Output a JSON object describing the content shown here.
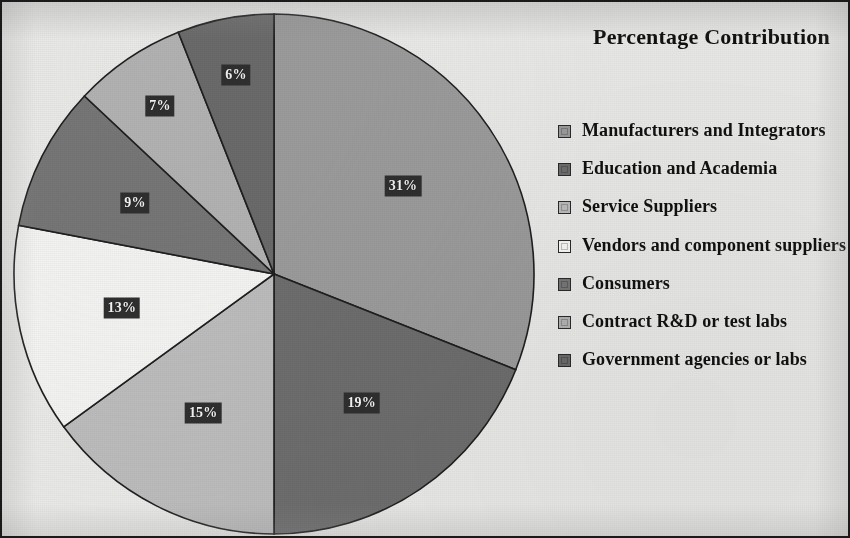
{
  "figure": {
    "title": "Percentage Contribution",
    "border_color": "#1a1a1a",
    "background_color": "#e9e9e7"
  },
  "chart_data": {
    "type": "pie",
    "title": "Percentage Contribution",
    "xlabel": "",
    "ylabel": "",
    "legend_position": "right",
    "grid": false,
    "start_angle_deg": 0,
    "direction": "clockwise",
    "units": "percent",
    "categories": [
      "Manufacturers and Integrators",
      "Education and Academia",
      "Service Suppliers",
      "Vendors and component suppliers",
      "Consumers",
      "Contract R&D or test labs",
      "Government agencies or labs"
    ],
    "values": [
      31,
      19,
      15,
      13,
      9,
      7,
      6
    ],
    "labels": [
      "31%",
      "19%",
      "15%",
      "13%",
      "9%",
      "7%",
      "6%"
    ],
    "colors": [
      "#9b9b9b",
      "#6d6d6d",
      "#bcbcbc",
      "#f3f3f1",
      "#767676",
      "#b2b2b2",
      "#6a6a6a"
    ],
    "slices": [
      {
        "label": "31%",
        "value": 31,
        "name": "Manufacturers and Integrators",
        "color": "#9b9b9b"
      },
      {
        "label": "19%",
        "value": 19,
        "name": "Education and Academia",
        "color": "#6d6d6d"
      },
      {
        "label": "15%",
        "value": 15,
        "name": "Service Suppliers",
        "color": "#bcbcbc"
      },
      {
        "label": "13%",
        "value": 13,
        "name": "Vendors and component suppliers",
        "color": "#f3f3f1"
      },
      {
        "label": "9%",
        "value": 9,
        "name": "Consumers",
        "color": "#767676"
      },
      {
        "label": "7%",
        "value": 7,
        "name": "Contract R&D or test labs",
        "color": "#b2b2b2"
      },
      {
        "label": "6%",
        "value": 6,
        "name": "Government agencies or labs",
        "color": "#6a6a6a"
      }
    ]
  },
  "legend": {
    "items": [
      {
        "label": "Manufacturers and Integrators",
        "color": "#9b9b9b"
      },
      {
        "label": "Education and Academia",
        "color": "#6d6d6d"
      },
      {
        "label": "Service Suppliers",
        "color": "#bcbcbc"
      },
      {
        "label": "Vendors and component suppliers",
        "color": "#f8f8f6"
      },
      {
        "label": "Consumers",
        "color": "#767676"
      },
      {
        "label": "Contract R&D or test labs",
        "color": "#b2b2b2"
      },
      {
        "label": "Government agencies or labs",
        "color": "#6a6a6a"
      }
    ]
  }
}
